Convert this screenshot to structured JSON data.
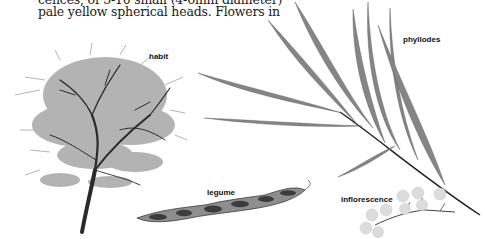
{
  "document": {
    "text_lines": [
      "cences, of 5-10 small (4-6mm diameter)",
      "pale yellow spherical heads. Flowers in"
    ]
  },
  "figure": {
    "labels": {
      "habit": "habit",
      "phyllodes": "phyllodes",
      "legume": "legume",
      "inflorescence": "inflorescence"
    },
    "colors": {
      "foliage": "#8a8a8a",
      "trunk": "#2a2a2a",
      "phyllode": "#7c7c7c",
      "flower": "#d8d8d8",
      "legume": "#6a6a6a"
    }
  }
}
